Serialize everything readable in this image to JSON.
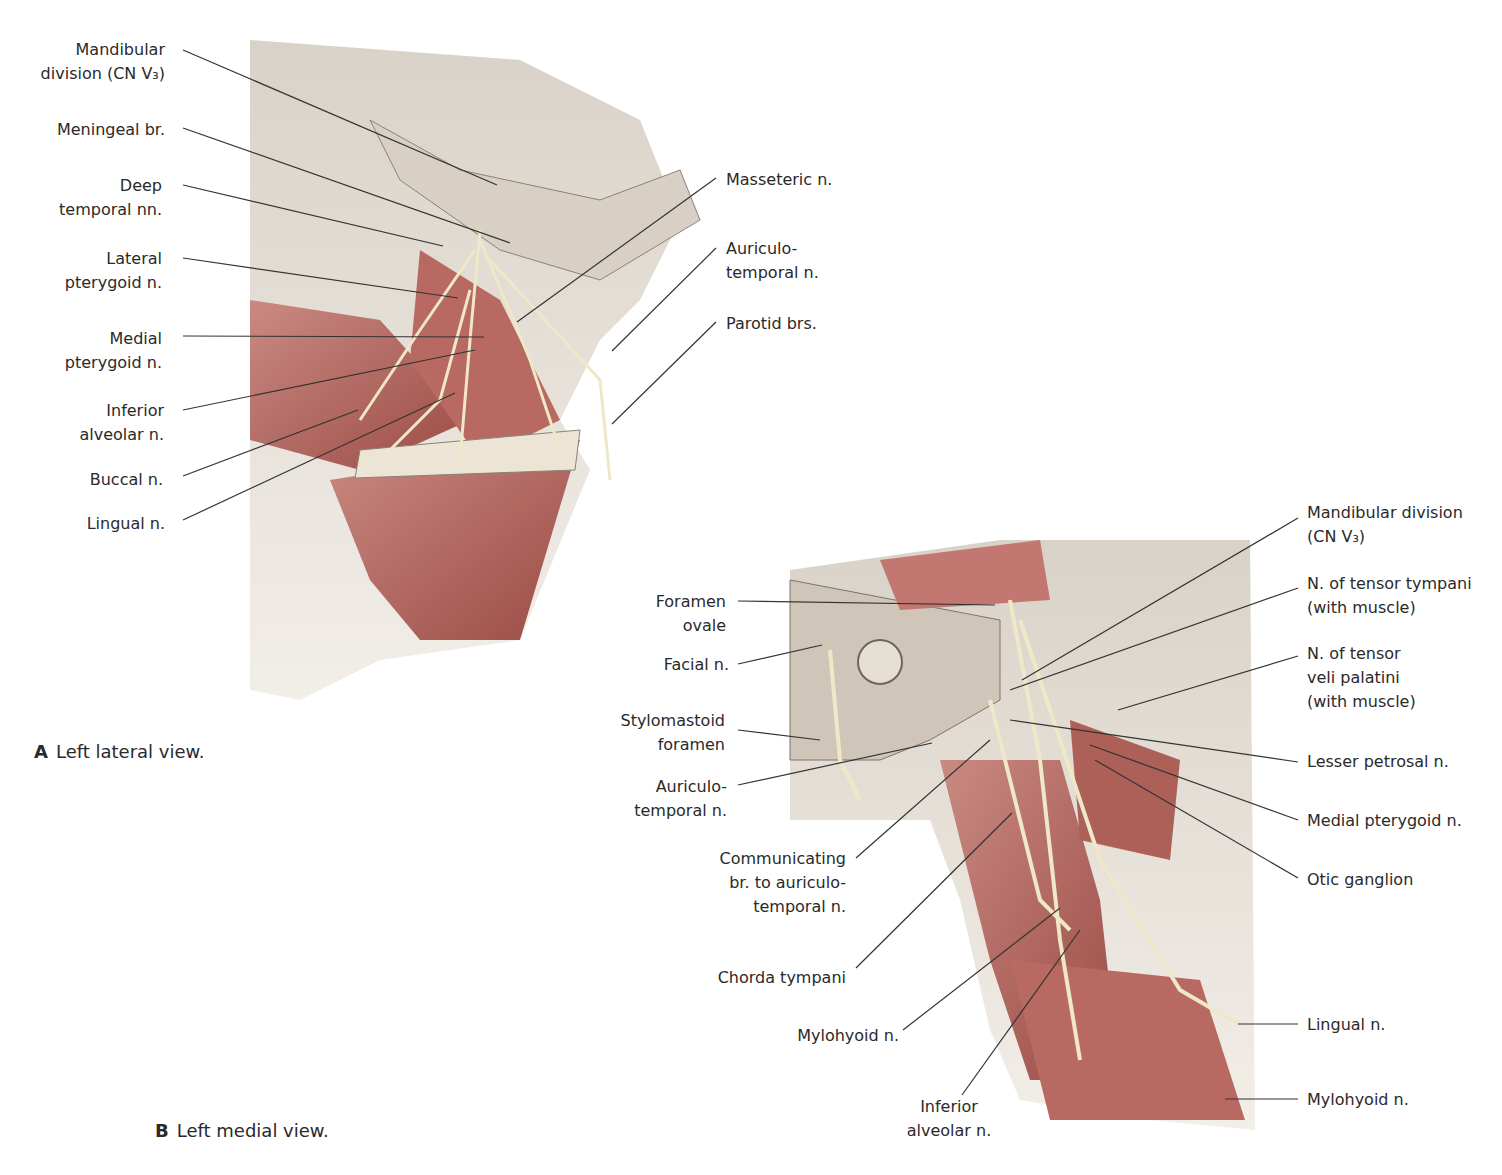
{
  "figure_a": {
    "caption_letter": "A",
    "caption_text": "Left lateral view.",
    "labels_left": [
      {
        "text": "Mandibular\ndivision (CN V₃)",
        "x": 0,
        "y": 38,
        "w": 165
      },
      {
        "text": "Meningeal br.",
        "x": 0,
        "y": 118,
        "w": 165
      },
      {
        "text": "Deep\ntemporal nn.",
        "x": 0,
        "y": 174,
        "w": 162
      },
      {
        "text": "Lateral\npterygoid n.",
        "x": 0,
        "y": 247,
        "w": 162
      },
      {
        "text": "Medial\npterygoid n.",
        "x": 0,
        "y": 327,
        "w": 162
      },
      {
        "text": "Inferior\nalveolar n.",
        "x": 0,
        "y": 399,
        "w": 164
      },
      {
        "text": "Buccal n.",
        "x": 0,
        "y": 468,
        "w": 163
      },
      {
        "text": "Lingual n.",
        "x": 0,
        "y": 512,
        "w": 165
      }
    ],
    "labels_right": [
      {
        "text": "Masseteric n.",
        "x": 726,
        "y": 168
      },
      {
        "text": "Auriculo-\ntemporal n.",
        "x": 726,
        "y": 237
      },
      {
        "text": "Parotid brs.",
        "x": 726,
        "y": 312
      }
    ]
  },
  "figure_b": {
    "caption_letter": "B",
    "caption_text": "Left medial view.",
    "labels_left": [
      {
        "text": "Foramen\novale",
        "x": 560,
        "y": 590,
        "w": 166
      },
      {
        "text": "Facial n.",
        "x": 560,
        "y": 653,
        "w": 169
      },
      {
        "text": "Stylomastoid\nforamen",
        "x": 560,
        "y": 709,
        "w": 165
      },
      {
        "text": "Auriculo-\ntemporal n.",
        "x": 560,
        "y": 775,
        "w": 167
      },
      {
        "text": "Communicating\nbr. to auriculo-\ntemporal n.",
        "x": 660,
        "y": 847,
        "w": 186
      },
      {
        "text": "Chorda tympani",
        "x": 660,
        "y": 966,
        "w": 186
      },
      {
        "text": "Mylohyoid n.",
        "x": 700,
        "y": 1024,
        "w": 199
      }
    ],
    "labels_bottom": [
      {
        "text": "Inferior\nalveolar n.",
        "x": 890,
        "y": 1095,
        "w": 118
      }
    ],
    "labels_right": [
      {
        "text": "Mandibular division\n(CN V₃)",
        "x": 1307,
        "y": 501
      },
      {
        "text": "N. of tensor tympani\n(with muscle)",
        "x": 1307,
        "y": 572
      },
      {
        "text": "N. of tensor\nveli palatini\n(with muscle)",
        "x": 1307,
        "y": 642
      },
      {
        "text": "Lesser petrosal n.",
        "x": 1307,
        "y": 750
      },
      {
        "text": "Medial pterygoid n.",
        "x": 1307,
        "y": 809
      },
      {
        "text": "Otic ganglion",
        "x": 1307,
        "y": 868
      },
      {
        "text": "Lingual n.",
        "x": 1307,
        "y": 1013
      },
      {
        "text": "Mylohyoid n.",
        "x": 1307,
        "y": 1088
      }
    ]
  },
  "colors": {
    "label_text": "#2a2a2a",
    "leader_line": "#333333",
    "muscle": "#b5655e",
    "bone": "#e8e1d8",
    "nerve": "#efe8c8"
  }
}
